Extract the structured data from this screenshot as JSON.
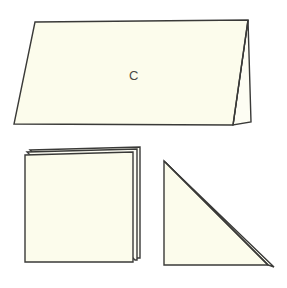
{
  "figure": {
    "background_color": "#ffffff",
    "paper_fill_color": "#fcfcec",
    "outline_color": "#3a3a38",
    "label_color": "#4a4a45",
    "canvas": {
      "width": 287,
      "height": 288
    }
  },
  "shapes": {
    "tent_card": {
      "name": "folded tent card",
      "label": "C",
      "label_position": {
        "x": 134,
        "y": 77
      },
      "front_panel_points": "35,22 248,20 233,125 14,124",
      "back_panel_points": "248,20 251,122 233,125",
      "fold_ridge": "248,20 233,125"
    },
    "square_card": {
      "name": "square folded card",
      "label": "",
      "front_panel_points": "25,155 133,152 133,262 25,262",
      "back_layer_one_points": "30,150 140,147 140,258 133,258",
      "back_layer_two_points": "27,152 137,149 137,260 135,260"
    },
    "triangle_fold": {
      "name": "triangle folded sheet",
      "label": "",
      "front_panel_points": "164,161 164,265 268,265",
      "back_layer_points": "166,163 274,267 268,265",
      "hypotenuse": "164,161 268,265"
    }
  },
  "labels": {
    "tent_card_letter": "C"
  }
}
